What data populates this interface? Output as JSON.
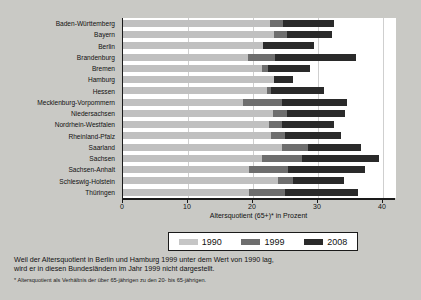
{
  "chart_data": {
    "type": "bar",
    "orientation": "horizontal",
    "title": "",
    "xlabel": "Altersquotient (65+)* in Prozent",
    "ylabel": "",
    "xlim": [
      0,
      42
    ],
    "xticks": [
      0,
      10,
      20,
      30,
      40
    ],
    "xticklabels": [
      "0",
      "10",
      "20",
      "30",
      "40"
    ],
    "grid": true,
    "grid_axis": "x",
    "legend_position": "below-axis",
    "stacked_cumulative": true,
    "categories": [
      "Baden-Württemberg",
      "Bayern",
      "Berlin",
      "Brandenburg",
      "Bremen",
      "Hamburg",
      "Hessen",
      "Mecklenburg-Vorpommern",
      "Niedersachsen",
      "Nordrhein-Westfalen",
      "Rheinland-Pfalz",
      "Saarland",
      "Sachsen",
      "Sachsen-Anhalt",
      "Schleswig-Holstein",
      "Thüringen"
    ],
    "series": [
      {
        "name": "1990",
        "color": "#c0c0c0",
        "values": [
          22.6,
          23.3,
          21.6,
          19.3,
          21.4,
          23.2,
          22.2,
          18.5,
          23.0,
          22.4,
          22.8,
          24.5,
          21.4,
          19.4,
          23.9,
          19.4
        ]
      },
      {
        "name": "1999",
        "color": "#6e6e6e",
        "values": [
          24.6,
          25.3,
          null,
          23.4,
          22.3,
          null,
          22.8,
          24.4,
          25.3,
          24.4,
          25.0,
          28.4,
          27.5,
          25.4,
          26.1,
          24.9
        ]
      },
      {
        "name": "2008",
        "color": "#2a2a2a",
        "values": [
          32.4,
          32.2,
          29.4,
          35.9,
          28.7,
          26.2,
          31.0,
          34.5,
          34.1,
          32.4,
          33.6,
          36.6,
          39.4,
          37.3,
          34.0,
          36.1
        ]
      }
    ]
  },
  "legend": {
    "items": [
      {
        "label": "1990",
        "color": "#c6c6c6"
      },
      {
        "label": "1999",
        "color": "#6e6e6e"
      },
      {
        "label": "2008",
        "color": "#2a2a2a"
      }
    ]
  },
  "notes": {
    "line1": "Weil der Altersquotient in Berlin und Hamburg 1999 unter dem Wert von 1990 lag,",
    "line2": "wird er in diesen Bundesländern im Jahr 1999 nicht dargestellt.",
    "footnote": "* Altersquotient als Verhältnis der über 65-jährigen zu den 20- bis 65-jährigen."
  }
}
